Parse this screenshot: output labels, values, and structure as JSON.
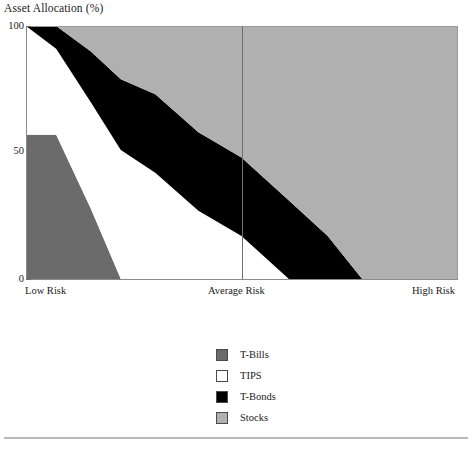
{
  "chart_data": {
    "type": "area",
    "title": "Asset Allocation (%)",
    "xlabel": "",
    "ylabel": "Asset Allocation (%)",
    "ylim": [
      0,
      100
    ],
    "yticks": [
      0,
      50,
      100
    ],
    "ytick_labels": [
      "0",
      "50",
      "100"
    ],
    "x_axis_type": "category-continuum",
    "x_tick_labels": [
      "Low Risk",
      "Average Risk",
      "High Risk"
    ],
    "x_tick_positions": [
      0,
      0.5,
      1
    ],
    "grid": false,
    "legend_position": "below-center",
    "stacked": true,
    "stack_total": 100,
    "x": [
      0,
      0.07,
      0.15,
      0.22,
      0.3,
      0.4,
      0.5,
      0.61,
      0.7,
      0.78,
      0.9,
      1
    ],
    "series": [
      {
        "name": "T-Bills",
        "color": "#6b6b6b",
        "values": [
          57,
          57,
          28,
          0,
          0,
          0,
          0,
          0,
          0,
          0,
          0,
          0
        ]
      },
      {
        "name": "TIPS",
        "color": "#ffffff",
        "values": [
          43,
          34,
          42,
          51,
          42,
          27,
          17,
          0,
          0,
          0,
          0,
          0
        ]
      },
      {
        "name": "T-Bonds",
        "color": "#000000",
        "values": [
          0,
          9,
          20,
          28,
          31,
          31,
          31,
          31,
          17,
          0,
          0,
          0
        ]
      },
      {
        "name": "Stocks",
        "color": "#b0b0b0",
        "values": [
          0,
          0,
          10,
          21,
          27,
          42,
          52,
          69,
          83,
          100,
          100,
          100
        ]
      }
    ],
    "annotations": [
      {
        "name": "average-risk-divider",
        "x": 0.5,
        "type": "vertical-line"
      }
    ]
  },
  "legend": {
    "items": [
      {
        "label": "T-Bills",
        "color": "#6b6b6b"
      },
      {
        "label": "TIPS",
        "color": "#ffffff"
      },
      {
        "label": "T-Bonds",
        "color": "#000000"
      },
      {
        "label": "Stocks",
        "color": "#b0b0b0"
      }
    ]
  },
  "axes": {
    "y_labels": [
      "100",
      "50",
      "0"
    ],
    "x_labels": {
      "low": "Low Risk",
      "average": "Average Risk",
      "high": "High Risk"
    }
  },
  "footer": {
    "note": ""
  }
}
